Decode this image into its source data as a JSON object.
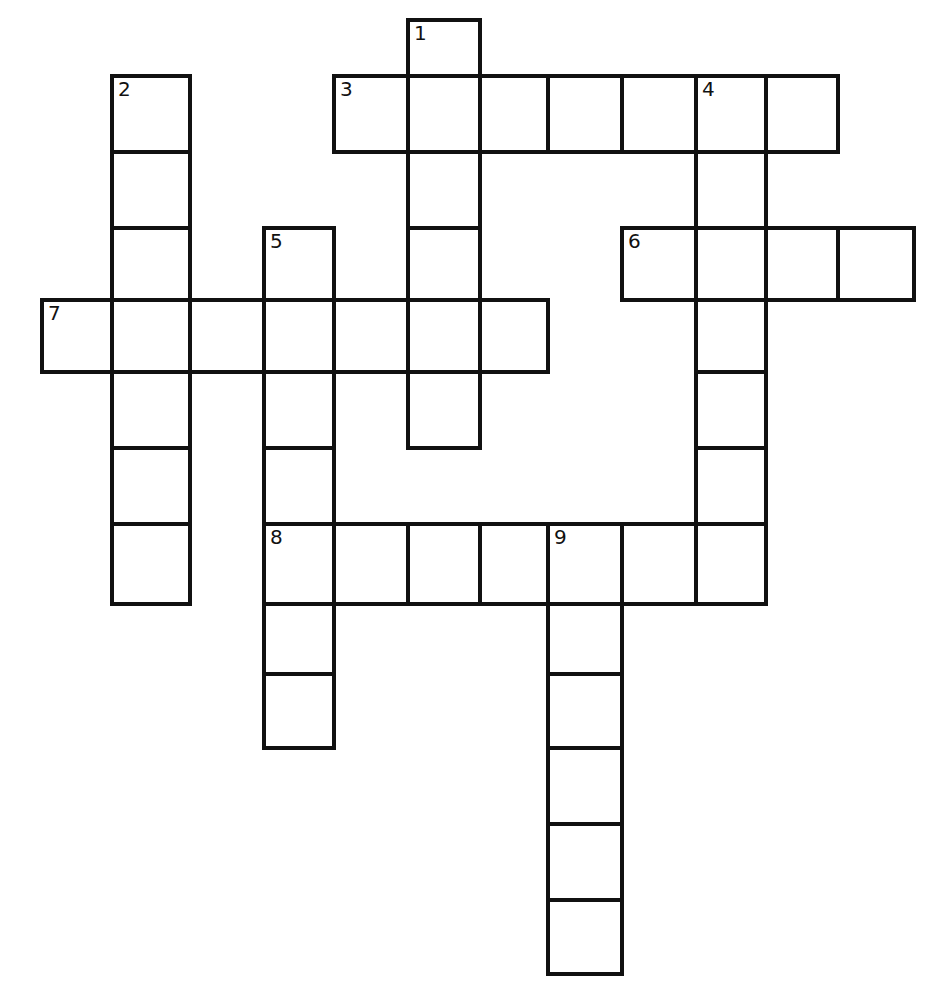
{
  "puzzle": {
    "type": "crossword",
    "line_color": "#111111",
    "background": "#ffffff",
    "col_edges": [
      42,
      112,
      190,
      264,
      334,
      408,
      480,
      548,
      622,
      696,
      766,
      838,
      914
    ],
    "row_edges": [
      20,
      76,
      152,
      228,
      300,
      372,
      448,
      524,
      604,
      674,
      748,
      824,
      900,
      974
    ],
    "entries": [
      {
        "number": "1",
        "direction": "down",
        "row": 0,
        "col": 5,
        "length": 6
      },
      {
        "number": "2",
        "direction": "down",
        "row": 1,
        "col": 1,
        "length": 7
      },
      {
        "number": "3",
        "direction": "across",
        "row": 1,
        "col": 4,
        "length": 7
      },
      {
        "number": "4",
        "direction": "down",
        "row": 1,
        "col": 9,
        "length": 7
      },
      {
        "number": "5",
        "direction": "down",
        "row": 3,
        "col": 3,
        "length": 7
      },
      {
        "number": "6",
        "direction": "across",
        "row": 3,
        "col": 8,
        "length": 4
      },
      {
        "number": "7",
        "direction": "across",
        "row": 4,
        "col": 0,
        "length": 7
      },
      {
        "number": "8",
        "direction": "across",
        "row": 7,
        "col": 3,
        "length": 7
      },
      {
        "number": "9",
        "direction": "down",
        "row": 7,
        "col": 7,
        "length": 6
      }
    ]
  }
}
